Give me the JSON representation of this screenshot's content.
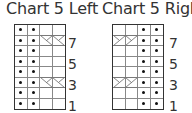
{
  "charts": [
    {
      "title": "Chart 5 Left",
      "rows": 8,
      "cols": 4,
      "row_labels": [
        "7",
        "5",
        "3",
        "1"
      ],
      "purl_columns": [
        0,
        1
      ],
      "cable_rows": [
        7,
        3
      ],
      "cable_type": "left-cross"
    },
    {
      "title": "Chart 5 Right",
      "rows": 8,
      "cols": 4,
      "row_labels": [
        "7",
        "5",
        "3",
        "1"
      ],
      "purl_columns": [
        2,
        3
      ],
      "cable_rows": [
        7,
        3
      ],
      "cable_type": "right-cross"
    }
  ],
  "colors": {
    "grid": "#333333",
    "inner_lines": "#888888",
    "dot": "#111111",
    "text": "#333333"
  }
}
